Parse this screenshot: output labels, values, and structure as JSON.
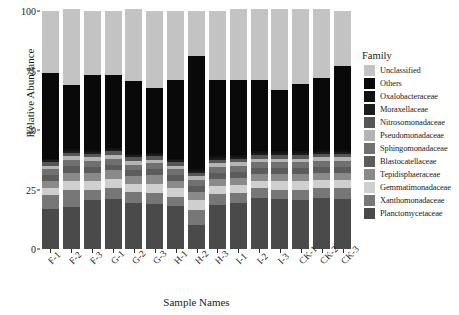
{
  "chart_data": {
    "type": "bar",
    "subtype": "stacked-bar-100",
    "title": "",
    "xlabel": "Sample Names",
    "ylabel": "Relative Abundance",
    "ylim": [
      0,
      100
    ],
    "yticks": [
      0,
      25,
      50,
      75,
      100
    ],
    "ytick_labels": [
      "0",
      "25",
      "50",
      "75",
      "100"
    ],
    "grid": false,
    "legend_position": "right",
    "legend_title": "Family",
    "categories": [
      "F-1",
      "F-2",
      "F-3",
      "G-1",
      "G-2",
      "G-3",
      "H-1",
      "H-2",
      "H-3",
      "I-1",
      "I-2",
      "I-3",
      "CK-1",
      "CK-2",
      "CK-3"
    ],
    "series": [
      {
        "name": "Planctomycetaceae",
        "color": "#4a4a4a",
        "values": [
          17.0,
          17.5,
          20.5,
          21.0,
          19.5,
          19.0,
          18.0,
          10.0,
          18.5,
          19.5,
          21.5,
          21.0,
          20.5,
          21.5,
          21.0
        ]
      },
      {
        "name": "Xanthomonadaceae",
        "color": "#777777",
        "values": [
          5.5,
          7.5,
          4.5,
          4.5,
          4.5,
          4.5,
          4.0,
          6.5,
          4.5,
          4.0,
          4.0,
          4.0,
          4.5,
          4.0,
          4.5
        ]
      },
      {
        "name": "Gemmatimonadaceae",
        "color": "#cfcfcf",
        "values": [
          3.0,
          3.5,
          3.5,
          4.0,
          3.5,
          4.0,
          3.5,
          4.0,
          3.5,
          3.5,
          3.0,
          3.5,
          3.5,
          3.5,
          3.5
        ]
      },
      {
        "name": "Tepidisphaeraceae",
        "color": "#8a8a8a",
        "values": [
          3.0,
          3.5,
          3.5,
          3.5,
          3.0,
          3.5,
          3.0,
          3.5,
          3.0,
          3.0,
          3.0,
          3.0,
          3.0,
          3.0,
          3.0
        ]
      },
      {
        "name": "Blastocatellaceae",
        "color": "#5c5c5c",
        "values": [
          2.5,
          3.0,
          2.5,
          2.5,
          2.5,
          2.5,
          2.5,
          2.5,
          2.5,
          2.5,
          2.5,
          2.5,
          2.5,
          2.5,
          2.5
        ]
      },
      {
        "name": "Sphingomonadaceae",
        "color": "#707070",
        "values": [
          2.5,
          2.5,
          2.5,
          2.5,
          2.5,
          2.5,
          2.5,
          2.5,
          2.5,
          2.5,
          2.5,
          2.5,
          2.5,
          2.5,
          2.5
        ]
      },
      {
        "name": "Pseudomonadaceae",
        "color": "#b4b4b4",
        "values": [
          1.5,
          1.5,
          1.5,
          1.5,
          1.5,
          1.5,
          1.5,
          1.5,
          1.5,
          1.5,
          1.5,
          1.5,
          1.5,
          1.5,
          1.5
        ]
      },
      {
        "name": "Nitrosomonadaceae",
        "color": "#565656",
        "values": [
          1.5,
          1.5,
          1.5,
          1.5,
          1.5,
          1.5,
          1.5,
          1.5,
          1.5,
          1.5,
          1.5,
          1.5,
          1.5,
          1.5,
          1.5
        ]
      },
      {
        "name": "Moraxellaceae",
        "color": "#1c1c1c",
        "values": [
          0.8,
          0.8,
          0.8,
          0.8,
          0.8,
          0.8,
          0.8,
          0.8,
          0.8,
          0.8,
          0.8,
          0.8,
          0.8,
          0.8,
          0.8
        ]
      },
      {
        "name": "Oxalobacteraceae",
        "color": "#111111",
        "values": [
          0.7,
          0.7,
          0.7,
          0.7,
          0.7,
          0.7,
          0.7,
          0.7,
          0.7,
          0.7,
          0.7,
          0.7,
          0.7,
          0.7,
          0.7
        ]
      },
      {
        "name": "Others",
        "color": "#090909",
        "values": [
          36.0,
          27.0,
          31.5,
          30.5,
          30.5,
          27.0,
          33.0,
          47.5,
          32.0,
          31.5,
          30.0,
          26.0,
          28.5,
          30.5,
          35.5
        ]
      },
      {
        "name": "Unclassified",
        "color": "#c3c3c3",
        "values": [
          26.0,
          31.5,
          27.0,
          27.0,
          30.0,
          32.5,
          29.0,
          19.0,
          29.0,
          29.5,
          29.8,
          33.8,
          31.3,
          28.8,
          23.0
        ]
      }
    ]
  },
  "axis": {
    "y_title": "Relative Abundance",
    "x_title": "Sample Names"
  },
  "legend": {
    "title": "Family",
    "items": [
      {
        "label": "Unclassified",
        "color": "#c3c3c3"
      },
      {
        "label": "Others",
        "color": "#090909"
      },
      {
        "label": "Oxalobacteraceae",
        "color": "#111111"
      },
      {
        "label": "Moraxellaceae",
        "color": "#1c1c1c"
      },
      {
        "label": "Nitrosomonadaceae",
        "color": "#565656"
      },
      {
        "label": "Pseudomonadaceae",
        "color": "#b4b4b4"
      },
      {
        "label": "Sphingomonadaceae",
        "color": "#707070"
      },
      {
        "label": "Blastocatellaceae",
        "color": "#5c5c5c"
      },
      {
        "label": "Tepidisphaeraceae",
        "color": "#8a8a8a"
      },
      {
        "label": "Gemmatimonadaceae",
        "color": "#cfcfcf"
      },
      {
        "label": "Xanthomonadaceae",
        "color": "#777777"
      },
      {
        "label": "Planctomycetaceae",
        "color": "#4a4a4a"
      }
    ]
  }
}
